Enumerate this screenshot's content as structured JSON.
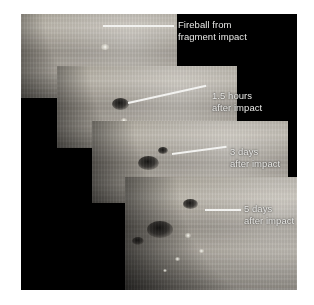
{
  "figure": {
    "background_color": "#ffffff",
    "frame_color": "#000000",
    "text_color": "#e8e8e6",
    "leader_color": "#f2f2f0"
  },
  "annotations": [
    {
      "id": "fireball",
      "line1": "Fireball from",
      "line2": "fragment impact",
      "text": "Fireball from\nfragment impact"
    },
    {
      "id": "hours-1-5",
      "line1": "1.5 hours",
      "line2": "after impact",
      "text": "1.5 hours\nafter impact"
    },
    {
      "id": "days-3",
      "line1": "3 days",
      "line2": "after impact",
      "text": "3 days\nafter impact"
    },
    {
      "id": "days-5",
      "line1": "5 days",
      "line2": "after impact",
      "text": "5 days\nafter impact"
    }
  ]
}
